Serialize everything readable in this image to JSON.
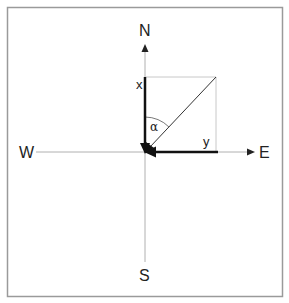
{
  "diagram": {
    "directions": {
      "north": "N",
      "south": "S",
      "east": "E",
      "west": "W"
    },
    "components": {
      "x_label": "x",
      "y_label": "y"
    },
    "angle": {
      "label": "α"
    },
    "colors": {
      "border": "#9a9a9a",
      "axis": "#b0b0b0",
      "box": "#c8c8c8",
      "vector": "#111111",
      "resultant": "#333333"
    }
  }
}
